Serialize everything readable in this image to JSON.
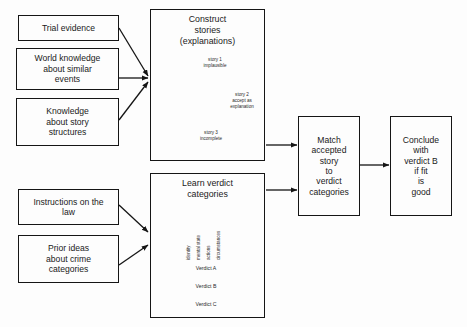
{
  "diagram": {
    "background_color": "#fdfdfd",
    "line_color": "#151515"
  },
  "inputs": {
    "evidence": {
      "label": "Trial evidence"
    },
    "world_knowledge": {
      "label": "World knowledge\nabout similar\nevents"
    },
    "story_structures": {
      "label": "Knowledge\nabout story\nstructures"
    },
    "instructions": {
      "label": "Instructions on the\nlaw"
    },
    "prior_ideas": {
      "label": "Prior  ideas\nabout crime\ncategories"
    }
  },
  "stages": {
    "construct": {
      "title": "Construct\nstories\n(explanations)",
      "stories": [
        {
          "id": "story1",
          "label": "story 1\nimplausible"
        },
        {
          "id": "story2",
          "label": "story 2\naccept as\nexplanation"
        },
        {
          "id": "story3",
          "label": "story 3\nincomplete"
        }
      ]
    },
    "learn": {
      "title": "Learn verdict\ncategories",
      "features": [
        "identity",
        "mental state",
        "actions",
        "circumstances"
      ],
      "verdicts": [
        "Verdict A",
        "Verdict B",
        "Verdict C"
      ]
    },
    "match": {
      "label": "Match\naccepted\nstory\nto\nverdict\ncategories"
    },
    "conclude": {
      "label": "Conclude\nwith\nverdict B\nif fit\nis\ngood"
    }
  }
}
